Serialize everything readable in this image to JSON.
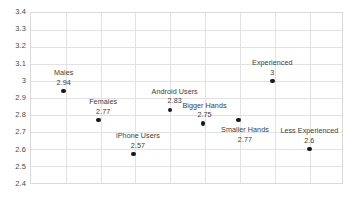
{
  "chart_data": {
    "type": "scatter",
    "title": "",
    "subtitle": "",
    "xlabel": "",
    "ylabel": "",
    "ylim": [
      2.4,
      3.4
    ],
    "y_ticks": [
      "2.4",
      "2.5",
      "2.6",
      "2.7",
      "2.8",
      "2.9",
      "3",
      "3.1",
      "3.2",
      "3.3",
      "3.4"
    ],
    "x_ticks": [],
    "x_tick_labels_shown": false,
    "grid": {
      "horizontal": true,
      "vertical": true,
      "color": "#e2e2e2"
    },
    "legend": {
      "shown": false,
      "position": "none"
    },
    "marker": {
      "shape": "circle",
      "color": "#1a1a1a",
      "size_px": 4.6
    },
    "plot_border_color": "#d9d9d9",
    "background_color": "#ffffff",
    "points": [
      {
        "label": "Males",
        "value": "2.94",
        "y": 2.94,
        "x_pos_pct": 10.5,
        "label_offset_x_pct": 0.0,
        "label_above": true
      },
      {
        "label": "Females",
        "value": "2.77",
        "y": 2.77,
        "x_pos_pct": 21.7,
        "label_offset_x_pct": 1.5,
        "label_above": true
      },
      {
        "label": "iPhone Users",
        "value": "2.57",
        "y": 2.57,
        "x_pos_pct": 32.9,
        "label_offset_x_pct": 1.5,
        "label_above": true
      },
      {
        "label": "Android Users",
        "value": "2.83",
        "y": 2.83,
        "x_pos_pct": 44.7,
        "label_offset_x_pct": 1.5,
        "label_above": true
      },
      {
        "label": "Bigger Hands",
        "value": "2.75",
        "y": 2.75,
        "x_pos_pct": 55.3,
        "label_offset_x_pct": 0.5,
        "label_above": true
      },
      {
        "label": "Smaller Hands",
        "value": "2.77",
        "y": 2.77,
        "x_pos_pct": 66.8,
        "label_offset_x_pct": 2.0,
        "label_above": false
      },
      {
        "label": "Experienced",
        "value": "3",
        "y": 3.0,
        "x_pos_pct": 77.6,
        "label_offset_x_pct": 0.0,
        "label_above": true
      },
      {
        "label": "Less Experienced",
        "value": "2.6",
        "y": 2.6,
        "x_pos_pct": 89.5,
        "label_offset_x_pct": 0.0,
        "label_above": true
      }
    ],
    "vertical_gridline_positions_pct": [
      11.2,
      22.4,
      33.6,
      44.8,
      56.0,
      67.2,
      78.4,
      89.6
    ]
  }
}
